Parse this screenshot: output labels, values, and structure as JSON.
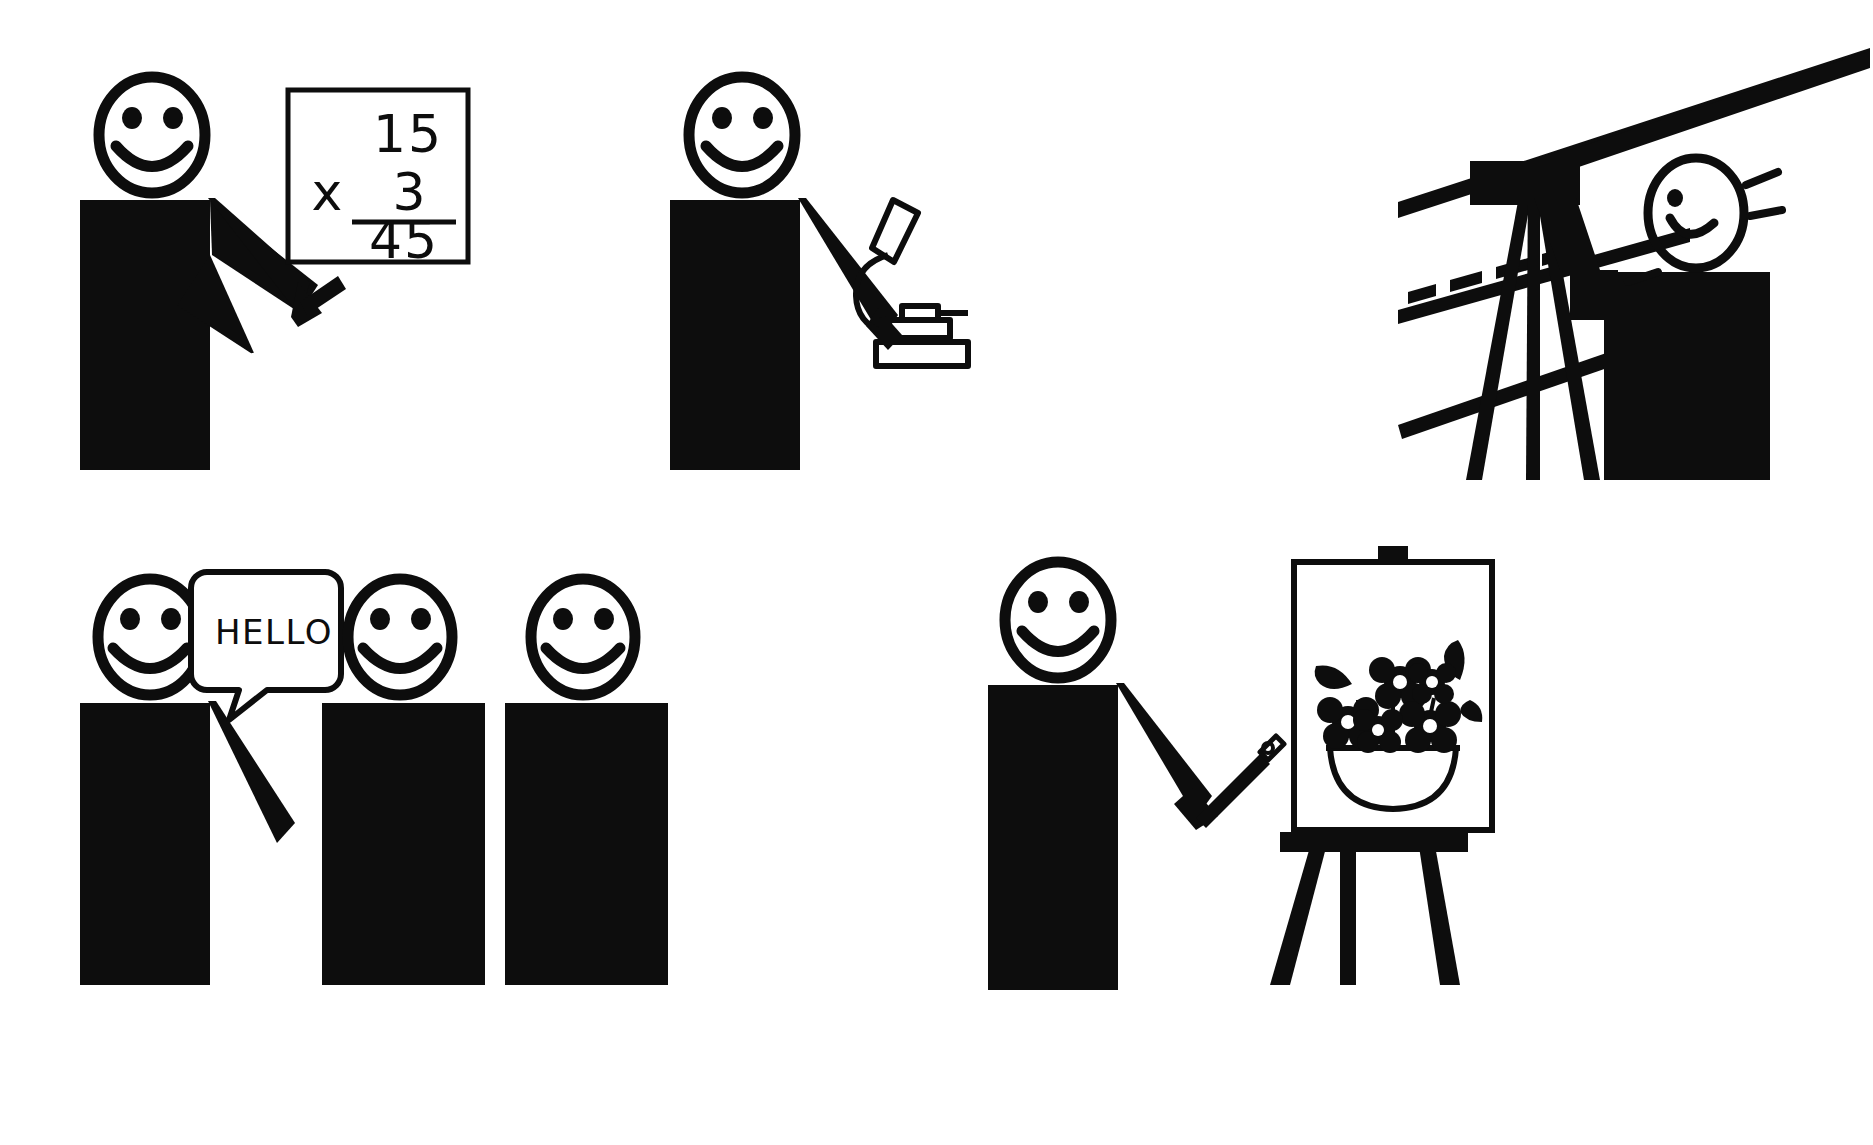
{
  "page": {
    "background_color": "#ffffff",
    "ink_color": "#0d0d0d",
    "width": 1873,
    "height": 1145
  },
  "scenes": [
    {
      "id": "math",
      "name": "student-doing-multiplication",
      "description": "Smiling stick figure pointing at a framed math problem",
      "board": {
        "multiplicand": "15",
        "operator": "x",
        "multiplier": "3",
        "product": "45"
      }
    },
    {
      "id": "microscope",
      "name": "student-using-microscope",
      "description": "Smiling stick figure with arm extended toward a microscope",
      "instrument_label": "microscope"
    },
    {
      "id": "telescope",
      "name": "student-using-telescope",
      "description": "Profile stick figure looking through a tripod mounted telescope at sight lines",
      "instrument_label": "telescope"
    },
    {
      "id": "greeting",
      "name": "students-greeting",
      "description": "Three smiling stick figures, the first waving and speaking",
      "speech_bubble": {
        "text": "HELLO"
      },
      "figure_count": 3
    },
    {
      "id": "painter",
      "name": "student-painting-at-easel",
      "description": "Smiling stick figure holding a paintbrush beside an easel with a bowl of flowers",
      "artwork_subject": "bowl of flowers",
      "tool_label": "paintbrush"
    }
  ]
}
